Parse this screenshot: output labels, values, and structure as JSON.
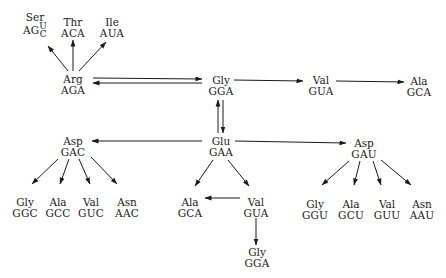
{
  "diagram": {
    "type": "codon-mutation-pathways",
    "colors": {
      "ink": "#1a1a1a",
      "background": "#ffffff"
    },
    "nodes": [
      {
        "id": "ser",
        "aa": "Ser",
        "codon_prefix": "AG",
        "codon_alts": [
          "U",
          "C"
        ],
        "x": 35,
        "y": 25
      },
      {
        "id": "thr",
        "aa": "Thr",
        "codon": "ACA",
        "x": 73,
        "y": 28
      },
      {
        "id": "ile",
        "aa": "Ile",
        "codon": "AUA",
        "x": 112,
        "y": 28
      },
      {
        "id": "arg",
        "aa": "Arg",
        "codon": "AGA",
        "x": 73,
        "y": 85
      },
      {
        "id": "gly_top",
        "aa": "Gly",
        "codon": "GGA",
        "x": 221,
        "y": 86
      },
      {
        "id": "val_top",
        "aa": "Val",
        "codon": "GUA",
        "x": 321,
        "y": 86
      },
      {
        "id": "ala_top",
        "aa": "Ala",
        "codon": "GCA",
        "x": 419,
        "y": 87
      },
      {
        "id": "glu",
        "aa": "Glu",
        "codon": "GAA",
        "x": 221,
        "y": 147
      },
      {
        "id": "asp_gac",
        "aa": "Asp",
        "codon": "GAC",
        "x": 73,
        "y": 147
      },
      {
        "id": "asp_gau",
        "aa": "Asp",
        "codon": "GAU",
        "x": 364,
        "y": 149
      },
      {
        "id": "gly_ggc",
        "aa": "Gly",
        "codon": "GGC",
        "x": 25,
        "y": 208
      },
      {
        "id": "ala_gcc",
        "aa": "Ala",
        "codon": "GCC",
        "x": 58,
        "y": 208
      },
      {
        "id": "val_guc",
        "aa": "Val",
        "codon": "GUC",
        "x": 91,
        "y": 208
      },
      {
        "id": "asn_aac",
        "aa": "Asn",
        "codon": "AAC",
        "x": 127,
        "y": 208
      },
      {
        "id": "ala_gca_mid",
        "aa": "Ala",
        "codon": "GCA",
        "x": 190,
        "y": 208
      },
      {
        "id": "val_gua_mid",
        "aa": "Val",
        "codon": "GUA",
        "x": 256,
        "y": 208
      },
      {
        "id": "gly_gga_bot",
        "aa": "Gly",
        "codon": "GGA",
        "x": 257,
        "y": 258
      },
      {
        "id": "gly_ggu",
        "aa": "Gly",
        "codon": "GGU",
        "x": 315,
        "y": 210
      },
      {
        "id": "ala_gcu",
        "aa": "Ala",
        "codon": "GCU",
        "x": 351,
        "y": 210
      },
      {
        "id": "val_guu",
        "aa": "Val",
        "codon": "GUU",
        "x": 387,
        "y": 210
      },
      {
        "id": "asn_aau",
        "aa": "Asn",
        "codon": "AAU",
        "x": 422,
        "y": 210
      }
    ],
    "edges": [
      {
        "from": "arg",
        "to": "ser",
        "x1": 68,
        "y1": 71,
        "x2": 48,
        "y2": 46
      },
      {
        "from": "arg",
        "to": "thr",
        "x1": 73,
        "y1": 71,
        "x2": 73,
        "y2": 40
      },
      {
        "from": "arg",
        "to": "ile",
        "x1": 79,
        "y1": 71,
        "x2": 106,
        "y2": 42
      },
      {
        "from": "arg",
        "to": "gly_top",
        "x1": 93,
        "y1": 78,
        "x2": 202,
        "y2": 79
      },
      {
        "from": "gly_top",
        "to": "arg",
        "x1": 202,
        "y1": 83,
        "x2": 93,
        "y2": 83
      },
      {
        "from": "gly_top",
        "to": "val_top",
        "x1": 234,
        "y1": 80,
        "x2": 303,
        "y2": 81
      },
      {
        "from": "val_top",
        "to": "ala_top",
        "x1": 336,
        "y1": 81,
        "x2": 404,
        "y2": 82
      },
      {
        "from": "glu",
        "to": "gly_top",
        "x1": 218,
        "y1": 133,
        "x2": 218,
        "y2": 100
      },
      {
        "from": "gly_top",
        "to": "glu",
        "x1": 223,
        "y1": 100,
        "x2": 223,
        "y2": 133
      },
      {
        "from": "glu",
        "to": "asp_gac",
        "x1": 202,
        "y1": 141,
        "x2": 92,
        "y2": 141
      },
      {
        "from": "glu",
        "to": "asp_gau",
        "x1": 235,
        "y1": 141,
        "x2": 346,
        "y2": 143
      },
      {
        "from": "asp_gac",
        "to": "gly_ggc",
        "x1": 58,
        "y1": 159,
        "x2": 32,
        "y2": 184
      },
      {
        "from": "asp_gac",
        "to": "ala_gcc",
        "x1": 69,
        "y1": 159,
        "x2": 60,
        "y2": 184
      },
      {
        "from": "asp_gac",
        "to": "val_guc",
        "x1": 79,
        "y1": 159,
        "x2": 90,
        "y2": 184
      },
      {
        "from": "asp_gac",
        "to": "asn_aac",
        "x1": 91,
        "y1": 157,
        "x2": 117,
        "y2": 184
      },
      {
        "from": "glu",
        "to": "ala_gca_mid",
        "x1": 213,
        "y1": 160,
        "x2": 195,
        "y2": 186
      },
      {
        "from": "glu",
        "to": "val_gua_mid",
        "x1": 228,
        "y1": 160,
        "x2": 249,
        "y2": 186
      },
      {
        "from": "val_gua_mid",
        "to": "ala_gca_mid",
        "x1": 240,
        "y1": 198,
        "x2": 205,
        "y2": 198
      },
      {
        "from": "val_gua_mid",
        "to": "gly_gga_bot",
        "x1": 256,
        "y1": 218,
        "x2": 256,
        "y2": 245
      },
      {
        "from": "asp_gau",
        "to": "gly_ggu",
        "x1": 349,
        "y1": 161,
        "x2": 322,
        "y2": 185
      },
      {
        "from": "asp_gau",
        "to": "ala_gcu",
        "x1": 360,
        "y1": 161,
        "x2": 354,
        "y2": 185
      },
      {
        "from": "asp_gau",
        "to": "val_guu",
        "x1": 373,
        "y1": 161,
        "x2": 381,
        "y2": 185
      },
      {
        "from": "asp_gau",
        "to": "asn_aau",
        "x1": 381,
        "y1": 160,
        "x2": 411,
        "y2": 185
      }
    ]
  }
}
